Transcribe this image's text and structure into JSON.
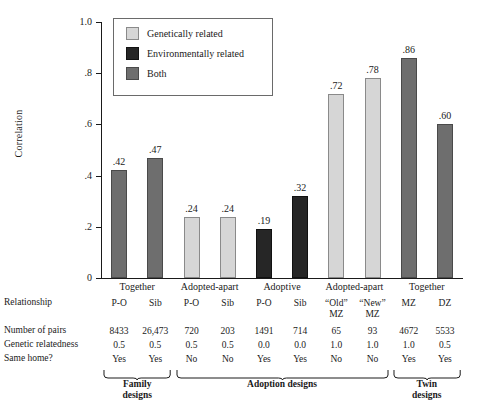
{
  "chart_data": {
    "type": "bar",
    "title": "",
    "xlabel": "",
    "ylabel": "Correlation",
    "ylim": [
      0,
      1.0
    ],
    "ytick_labels": [
      "0",
      ".2",
      ".4",
      ".6",
      ".8",
      "1.0"
    ],
    "ytick_values": [
      0,
      0.2,
      0.4,
      0.6,
      0.8,
      1.0
    ],
    "grid": false,
    "legend_position": "top-left-inside",
    "legend": [
      {
        "key": "genetic",
        "label": "Genetically related",
        "color": "#d6d6d6"
      },
      {
        "key": "environment",
        "label": "Environmentally related",
        "color": "#262626"
      },
      {
        "key": "both",
        "label": "Both",
        "color": "#6e6e6e"
      }
    ],
    "categories": [
      "P-O",
      "Sib",
      "P-O",
      "Sib",
      "P-O",
      "Sib",
      "“Old” MZ",
      "“New” MZ",
      "MZ",
      "DZ"
    ],
    "values": [
      0.42,
      0.47,
      0.24,
      0.24,
      0.19,
      0.32,
      0.72,
      0.78,
      0.86,
      0.6
    ],
    "value_labels": [
      ".42",
      ".47",
      ".24",
      ".24",
      ".19",
      ".32",
      ".72",
      ".78",
      ".86",
      ".60"
    ],
    "bar_types": [
      "both",
      "both",
      "genetic",
      "genetic",
      "environment",
      "environment",
      "genetic",
      "genetic",
      "both",
      "both"
    ],
    "bars": [
      {
        "label": ".42",
        "value": 0.42,
        "type": "both",
        "relationship": "P-O",
        "relationship_line2": "",
        "pairs": "8433",
        "relatedness": "0.5",
        "same_home": "Yes"
      },
      {
        "label": ".47",
        "value": 0.47,
        "type": "both",
        "relationship": "Sib",
        "relationship_line2": "",
        "pairs": "26,473",
        "relatedness": "0.5",
        "same_home": "Yes"
      },
      {
        "label": ".24",
        "value": 0.24,
        "type": "genetic",
        "relationship": "P-O",
        "relationship_line2": "",
        "pairs": "720",
        "relatedness": "0.5",
        "same_home": "No"
      },
      {
        "label": ".24",
        "value": 0.24,
        "type": "genetic",
        "relationship": "Sib",
        "relationship_line2": "",
        "pairs": "203",
        "relatedness": "0.5",
        "same_home": "No"
      },
      {
        "label": ".19",
        "value": 0.19,
        "type": "environment",
        "relationship": "P-O",
        "relationship_line2": "",
        "pairs": "1491",
        "relatedness": "0.0",
        "same_home": "Yes"
      },
      {
        "label": ".32",
        "value": 0.32,
        "type": "environment",
        "relationship": "Sib",
        "relationship_line2": "",
        "pairs": "714",
        "relatedness": "0.0",
        "same_home": "Yes"
      },
      {
        "label": ".72",
        "value": 0.72,
        "type": "genetic",
        "relationship": "“Old”",
        "relationship_line2": "MZ",
        "pairs": "65",
        "relatedness": "1.0",
        "same_home": "No"
      },
      {
        "label": ".78",
        "value": 0.78,
        "type": "genetic",
        "relationship": "“New”",
        "relationship_line2": "MZ",
        "pairs": "93",
        "relatedness": "1.0",
        "same_home": "No"
      },
      {
        "label": ".86",
        "value": 0.86,
        "type": "both",
        "relationship": "MZ",
        "relationship_line2": "",
        "pairs": "4672",
        "relatedness": "1.0",
        "same_home": "Yes"
      },
      {
        "label": ".60",
        "value": 0.6,
        "type": "both",
        "relationship": "DZ",
        "relationship_line2": "",
        "pairs": "5533",
        "relatedness": "0.5",
        "same_home": "Yes"
      }
    ],
    "group_headings": [
      {
        "label": "Together",
        "first_bar": 0,
        "last_bar": 1
      },
      {
        "label": "Adopted-apart",
        "first_bar": 2,
        "last_bar": 3
      },
      {
        "label": "Adoptive",
        "first_bar": 4,
        "last_bar": 5
      },
      {
        "label": "Adopted-apart",
        "first_bar": 6,
        "last_bar": 7
      },
      {
        "label": "Together",
        "first_bar": 8,
        "last_bar": 9
      }
    ],
    "design_groups": [
      {
        "line1": "Family",
        "line2": "designs",
        "first_bar": 0,
        "last_bar": 1
      },
      {
        "line1": "Adoption designs",
        "line2": "",
        "first_bar": 2,
        "last_bar": 7
      },
      {
        "line1": "Twin",
        "line2": "designs",
        "first_bar": 8,
        "last_bar": 9
      }
    ]
  },
  "table": {
    "row_labels": {
      "relationship": "Relationship",
      "pairs": "Number of pairs",
      "relatedness": "Genetic relatedness",
      "same_home": "Same home?"
    }
  }
}
